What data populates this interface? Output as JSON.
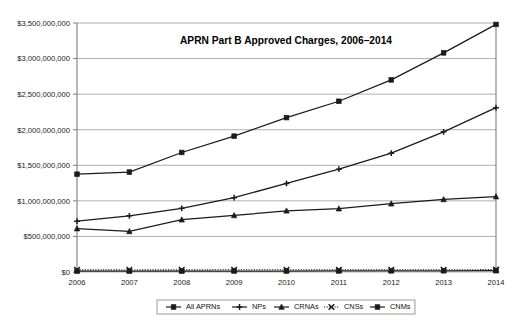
{
  "chart_data": {
    "type": "line",
    "title": "APRN Part B Approved Charges, 2006–2014",
    "xlabel": "",
    "ylabel": "",
    "categories": [
      "2006",
      "2007",
      "2008",
      "2009",
      "2010",
      "2011",
      "2012",
      "2013",
      "2014"
    ],
    "x": [
      2006,
      2007,
      2008,
      2009,
      2010,
      2011,
      2012,
      2013,
      2014
    ],
    "ylim": [
      0,
      3500000000
    ],
    "ytick_values": [
      0,
      500000000,
      1000000000,
      1500000000,
      2000000000,
      2500000000,
      3000000000,
      3500000000
    ],
    "ytick_labels": [
      "$0",
      "$500,000,000",
      "$1,000,000,000",
      "$1,500,000,000",
      "$2,000,000,000",
      "$2,500,000,000",
      "$3,000,000,000",
      "$3,500,000,000"
    ],
    "grid": true,
    "legend_position": "bottom",
    "series": [
      {
        "name": "All APRNs",
        "marker": "square",
        "linestyle": "solid",
        "values": [
          1375000000,
          1405000000,
          1680000000,
          1910000000,
          2170000000,
          2400000000,
          2700000000,
          3080000000,
          3480000000
        ]
      },
      {
        "name": "NPs",
        "marker": "plus",
        "linestyle": "dashdot",
        "values": [
          715000000,
          790000000,
          895000000,
          1045000000,
          1245000000,
          1445000000,
          1670000000,
          1970000000,
          2310000000
        ]
      },
      {
        "name": "CRNAs",
        "marker": "triangle",
        "linestyle": "solid",
        "values": [
          610000000,
          570000000,
          735000000,
          795000000,
          860000000,
          890000000,
          960000000,
          1020000000,
          1060000000
        ]
      },
      {
        "name": "CNSs",
        "marker": "x",
        "linestyle": "dotted",
        "values": [
          30000000,
          29000000,
          30000000,
          31000000,
          31000000,
          31000000,
          31000000,
          32000000,
          33000000
        ]
      },
      {
        "name": "CNMs",
        "marker": "square",
        "linestyle": "solid",
        "values": [
          12000000,
          12000000,
          13000000,
          14000000,
          14000000,
          15000000,
          16000000,
          17000000,
          18000000
        ]
      }
    ],
    "colors": {
      "series_stroke": "#1b1b1b",
      "gridline": "#9a9a9a",
      "axis": "#7e7e7e",
      "background": "#ffffff",
      "text": "#111111"
    }
  },
  "legend": {
    "items": [
      {
        "label": "All APRNs"
      },
      {
        "label": "NPs"
      },
      {
        "label": "CRNAs"
      },
      {
        "label": "CNSs"
      },
      {
        "label": "CNMs"
      }
    ]
  }
}
